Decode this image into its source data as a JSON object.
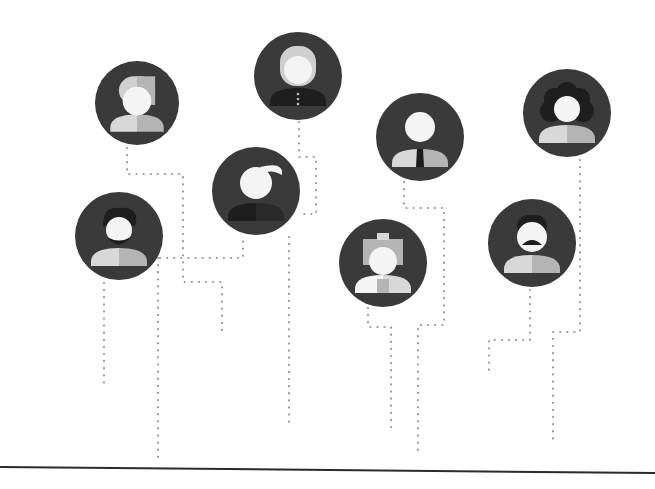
{
  "colors": {
    "background": "#ffffff",
    "circle": "#3a3a3a",
    "face": "#f4f4f4",
    "body_light": "#d8d8d8",
    "body_mid": "#b4b4b4",
    "hair_dark": "#1e1e1e",
    "hair_light": "#cfcfcf",
    "dots": "#9a9a9a",
    "baseline": "#2a2a2a"
  },
  "avatars": [
    {
      "id": "woman-short-hair",
      "cx": 137,
      "cy": 103,
      "r": 42
    },
    {
      "id": "woman-long-hair",
      "cx": 298,
      "cy": 76,
      "r": 44
    },
    {
      "id": "man-tie",
      "cx": 420,
      "cy": 137,
      "r": 44
    },
    {
      "id": "woman-curly-hair",
      "cx": 567,
      "cy": 113,
      "r": 44
    },
    {
      "id": "man-quiff",
      "cx": 256,
      "cy": 191,
      "r": 44
    },
    {
      "id": "man-beard",
      "cx": 119,
      "cy": 236,
      "r": 44
    },
    {
      "id": "girl-bow",
      "cx": 383,
      "cy": 263,
      "r": 44
    },
    {
      "id": "woman-mustache",
      "cx": 532,
      "cy": 243,
      "r": 44
    }
  ],
  "connectors": [
    {
      "from": "woman-short-hair",
      "points": [
        [
          127,
          148
        ],
        [
          127,
          174
        ],
        [
          183,
          174
        ],
        [
          183,
          282
        ],
        [
          222,
          282
        ],
        [
          222,
          332
        ]
      ]
    },
    {
      "from": "man-beard",
      "points": [
        [
          104,
          283
        ],
        [
          104,
          388
        ]
      ]
    },
    {
      "from": "man-beard",
      "points": [
        [
          160,
          258
        ],
        [
          243,
          258
        ],
        [
          243,
          235
        ]
      ]
    },
    {
      "from": "man-beard",
      "points": [
        [
          158,
          258
        ],
        [
          158,
          463
        ]
      ]
    },
    {
      "from": "woman-long-hair",
      "points": [
        [
          299,
          122
        ],
        [
          299,
          157
        ],
        [
          316,
          157
        ],
        [
          316,
          214
        ],
        [
          300,
          214
        ]
      ]
    },
    {
      "from": "man-quiff",
      "points": [
        [
          289,
          237
        ],
        [
          289,
          422
        ]
      ]
    },
    {
      "from": "man-tie",
      "points": [
        [
          404,
          182
        ],
        [
          404,
          208
        ],
        [
          444,
          208
        ],
        [
          444,
          325
        ],
        [
          418,
          325
        ],
        [
          418,
          450
        ]
      ]
    },
    {
      "from": "girl-bow",
      "points": [
        [
          368,
          308
        ],
        [
          368,
          327
        ],
        [
          391,
          327
        ],
        [
          391,
          433
        ]
      ]
    },
    {
      "from": "woman-curly-hair",
      "points": [
        [
          580,
          160
        ],
        [
          580,
          332
        ],
        [
          553,
          332
        ],
        [
          553,
          441
        ]
      ]
    },
    {
      "from": "woman-mustache",
      "points": [
        [
          530,
          290
        ],
        [
          530,
          340
        ],
        [
          489,
          340
        ],
        [
          489,
          373
        ]
      ]
    }
  ],
  "baseline": {
    "x1": 0,
    "y1": 467,
    "x2": 655,
    "y2": 473
  }
}
